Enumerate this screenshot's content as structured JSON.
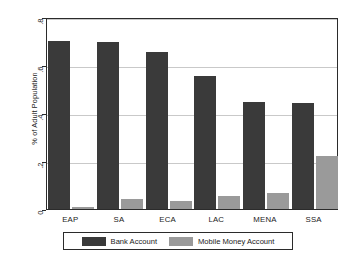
{
  "chart_data": {
    "type": "bar",
    "title": "",
    "xlabel": "",
    "ylabel": "% of Adult Population",
    "categories": [
      "EAP",
      "SA",
      "ECA",
      "LAC",
      "MENA",
      "SSA"
    ],
    "series": [
      {
        "name": "Bank Account",
        "color": "#3a3a3a",
        "values": [
          0.7,
          0.695,
          0.655,
          0.555,
          0.445,
          0.44
        ]
      },
      {
        "name": "Mobile Money Account",
        "color": "#9a9a9a",
        "values": [
          0.01,
          0.04,
          0.035,
          0.055,
          0.065,
          0.22
        ]
      }
    ],
    "ylim": [
      0,
      0.8
    ],
    "ytick_values": [
      0,
      0.2,
      0.4,
      0.6,
      0.8
    ],
    "ytick_labels": [
      "0",
      ".2",
      ".4",
      ".6",
      ".8"
    ],
    "grid": "horizontal",
    "legend_position": "bottom"
  },
  "legend": {
    "entries": [
      {
        "label": "Bank Account",
        "swatch": "bank-swatch"
      },
      {
        "label": "Mobile Money Account",
        "swatch": "mobile-money-swatch"
      }
    ]
  }
}
